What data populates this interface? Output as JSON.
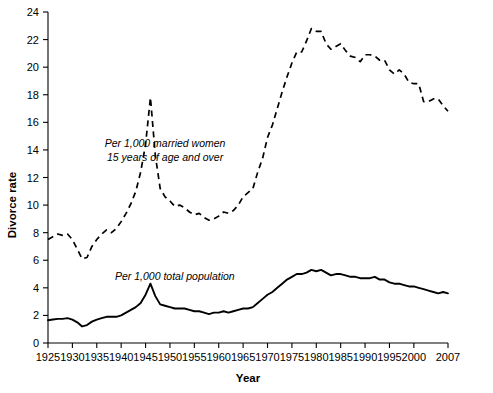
{
  "chart_data": {
    "type": "line",
    "title": "",
    "xlabel": "Year",
    "ylabel": "Divorce rate",
    "xlim": [
      1925,
      2007
    ],
    "ylim": [
      0,
      24
    ],
    "grid": false,
    "legend_position": "inline-annotation",
    "x_ticks": [
      1925,
      1930,
      1935,
      1940,
      1945,
      1950,
      1955,
      1960,
      1965,
      1970,
      1975,
      1980,
      1985,
      1990,
      1995,
      2000,
      2007
    ],
    "x_tick_labels": [
      "1925",
      "1930",
      "1935",
      "1940",
      "1945",
      "1950",
      "1955",
      "1960",
      "1965",
      "1970",
      "1975",
      "1980",
      "1985",
      "1990",
      "1995",
      "2000",
      "2007"
    ],
    "y_ticks": [
      0,
      2,
      4,
      6,
      8,
      10,
      12,
      14,
      16,
      18,
      20,
      22,
      24
    ],
    "y_tick_labels": [
      "0",
      "2",
      "4",
      "6",
      "8",
      "10",
      "12",
      "14",
      "16",
      "18",
      "20",
      "22",
      "24"
    ],
    "annotations": [
      {
        "name": "married-women-label",
        "lines": [
          "Per 1,000 married women",
          "15 years of age and over"
        ],
        "x": 1949,
        "y": 14.2
      },
      {
        "name": "total-population-label",
        "lines": [
          "Per 1,000 total population"
        ],
        "x": 1951,
        "y": 4.6
      }
    ],
    "series": [
      {
        "name": "Per 1,000 married women 15 years of age and over",
        "style": "dashed",
        "x": [
          1925,
          1926,
          1927,
          1928,
          1929,
          1930,
          1931,
          1932,
          1933,
          1934,
          1935,
          1936,
          1937,
          1938,
          1939,
          1940,
          1941,
          1942,
          1943,
          1944,
          1945,
          1946,
          1947,
          1948,
          1949,
          1950,
          1951,
          1952,
          1953,
          1954,
          1955,
          1956,
          1957,
          1958,
          1959,
          1960,
          1961,
          1962,
          1963,
          1964,
          1965,
          1966,
          1967,
          1968,
          1969,
          1970,
          1971,
          1972,
          1973,
          1974,
          1975,
          1976,
          1977,
          1978,
          1979,
          1980,
          1981,
          1982,
          1983,
          1984,
          1985,
          1986,
          1987,
          1988,
          1989,
          1990,
          1991,
          1992,
          1993,
          1994,
          1995,
          1996,
          1997,
          1998,
          1999,
          2000,
          2001,
          2002,
          2003,
          2004,
          2005,
          2006,
          2007
        ],
        "y": [
          7.5,
          7.7,
          7.9,
          7.8,
          7.9,
          7.5,
          6.8,
          6.1,
          6.2,
          7.0,
          7.5,
          7.9,
          8.2,
          8.0,
          8.3,
          8.8,
          9.4,
          10.1,
          11.0,
          12.4,
          14.4,
          17.8,
          13.6,
          11.2,
          10.6,
          10.3,
          9.9,
          10.0,
          9.8,
          9.5,
          9.3,
          9.4,
          9.1,
          8.9,
          9.0,
          9.2,
          9.5,
          9.4,
          9.6,
          10.0,
          10.6,
          10.9,
          11.2,
          12.4,
          13.4,
          14.9,
          15.8,
          17.0,
          18.2,
          19.3,
          20.3,
          21.1,
          21.1,
          21.9,
          22.8,
          22.6,
          22.6,
          21.7,
          21.3,
          21.5,
          21.7,
          21.2,
          20.8,
          20.7,
          20.4,
          20.9,
          20.9,
          20.8,
          20.5,
          20.5,
          19.8,
          19.5,
          19.8,
          19.5,
          18.9,
          18.8,
          18.8,
          17.5,
          17.5,
          17.7,
          17.7,
          17.2,
          16.8
        ]
      },
      {
        "name": "Per 1,000 total population",
        "style": "solid",
        "x": [
          1925,
          1926,
          1927,
          1928,
          1929,
          1930,
          1931,
          1932,
          1933,
          1934,
          1935,
          1936,
          1937,
          1938,
          1939,
          1940,
          1941,
          1942,
          1943,
          1944,
          1945,
          1946,
          1947,
          1948,
          1949,
          1950,
          1951,
          1952,
          1953,
          1954,
          1955,
          1956,
          1957,
          1958,
          1959,
          1960,
          1961,
          1962,
          1963,
          1964,
          1965,
          1966,
          1967,
          1968,
          1969,
          1970,
          1971,
          1972,
          1973,
          1974,
          1975,
          1976,
          1977,
          1978,
          1979,
          1980,
          1981,
          1982,
          1983,
          1984,
          1985,
          1986,
          1987,
          1988,
          1989,
          1990,
          1991,
          1992,
          1993,
          1994,
          1995,
          1996,
          1997,
          1998,
          1999,
          2000,
          2001,
          2002,
          2003,
          2004,
          2005,
          2006,
          2007
        ],
        "y": [
          1.65,
          1.7,
          1.75,
          1.75,
          1.8,
          1.7,
          1.5,
          1.2,
          1.3,
          1.55,
          1.7,
          1.8,
          1.9,
          1.9,
          1.9,
          2.0,
          2.2,
          2.4,
          2.6,
          2.9,
          3.5,
          4.3,
          3.4,
          2.8,
          2.7,
          2.6,
          2.5,
          2.5,
          2.5,
          2.4,
          2.3,
          2.3,
          2.2,
          2.1,
          2.2,
          2.2,
          2.3,
          2.2,
          2.3,
          2.4,
          2.5,
          2.5,
          2.6,
          2.9,
          3.2,
          3.5,
          3.7,
          4.0,
          4.3,
          4.6,
          4.8,
          5.0,
          5.0,
          5.1,
          5.3,
          5.2,
          5.3,
          5.1,
          4.9,
          5.0,
          5.0,
          4.9,
          4.8,
          4.8,
          4.7,
          4.7,
          4.7,
          4.8,
          4.6,
          4.6,
          4.4,
          4.3,
          4.3,
          4.2,
          4.1,
          4.1,
          4.0,
          3.9,
          3.8,
          3.7,
          3.6,
          3.7,
          3.6
        ]
      }
    ]
  }
}
